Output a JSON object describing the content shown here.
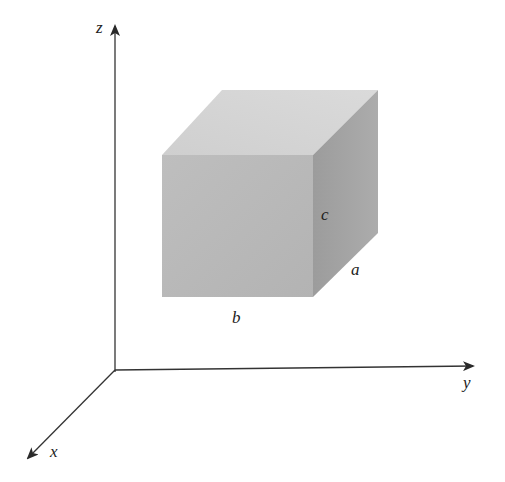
{
  "diagram": {
    "type": "3d-coordinate-box",
    "axes": {
      "x": {
        "label": "x"
      },
      "y": {
        "label": "y"
      },
      "z": {
        "label": "z"
      }
    },
    "box": {
      "edge_labels": {
        "width": "b",
        "height": "c",
        "depth": "a"
      }
    },
    "colors": {
      "front_face": "#b9b9b9",
      "top_face": "#d4d4d4",
      "right_face": "#a3a3a3",
      "axis": "#333333",
      "background": "#ffffff"
    }
  }
}
